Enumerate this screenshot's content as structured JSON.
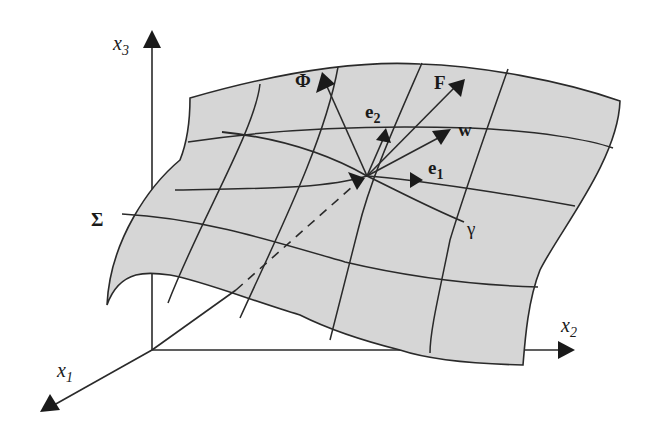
{
  "figure": {
    "type": "diagram",
    "colors": {
      "background": "#ffffff",
      "surface_fill": "#d6d6d6",
      "line": "#2a2a2a"
    },
    "axes": {
      "x1": {
        "name": "x",
        "sub": "1"
      },
      "x2": {
        "name": "x",
        "sub": "2"
      },
      "x3": {
        "name": "x",
        "sub": "3"
      }
    },
    "surface": {
      "label": "Σ"
    },
    "curve": {
      "label": "γ"
    },
    "vectors": {
      "phi": {
        "label": "Φ"
      },
      "F": {
        "label": "F"
      },
      "e2": {
        "name": "e",
        "sub": "2"
      },
      "w": {
        "label": "w"
      },
      "e1": {
        "name": "e",
        "sub": "1"
      }
    }
  }
}
